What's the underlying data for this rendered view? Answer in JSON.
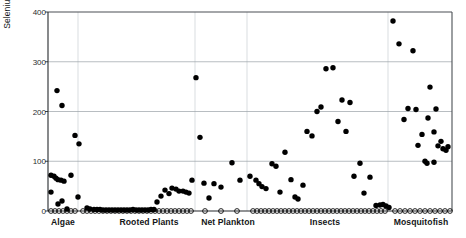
{
  "chart_data": {
    "type": "scatter",
    "title": "",
    "xlabel": "",
    "ylabel": "Selenium (µg/g, dw)",
    "ylim": [
      0,
      400
    ],
    "yticks": [
      0,
      100,
      200,
      300,
      400
    ],
    "ytick_labels": [
      "0",
      "100",
      "200",
      "300",
      "400"
    ],
    "grid": "horizontal-and-vertical-faint",
    "legend": "none",
    "categories": [
      "Algae",
      "Rooted Plants",
      "Net Plankton",
      "Insects",
      "Mosquitofish"
    ],
    "category_label_x": [
      63,
      149,
      228,
      325,
      421
    ],
    "group_dividers_x": [
      78,
      195,
      247,
      388
    ],
    "marker_detected": "filled-circle",
    "marker_nondetect": "open-circle",
    "series": [
      {
        "name": "Detected samples",
        "marker": "filled-circle",
        "color": "#000000",
        "points": [
          [
            51,
            72
          ],
          [
            54,
            70
          ],
          [
            56,
            66
          ],
          [
            58,
            63
          ],
          [
            61,
            62
          ],
          [
            64,
            60
          ],
          [
            51,
            38
          ],
          [
            58,
            14
          ],
          [
            62,
            20
          ],
          [
            67,
            4
          ],
          [
            57,
            242
          ],
          [
            62,
            212
          ],
          [
            75,
            152
          ],
          [
            79,
            135
          ],
          [
            71,
            72
          ],
          [
            78,
            28
          ],
          [
            87,
            6
          ],
          [
            90,
            4
          ],
          [
            94,
            3
          ],
          [
            97,
            3
          ],
          [
            100,
            3
          ],
          [
            103,
            2
          ],
          [
            106,
            2
          ],
          [
            109,
            2
          ],
          [
            112,
            2
          ],
          [
            115,
            2
          ],
          [
            118,
            2
          ],
          [
            121,
            2
          ],
          [
            124,
            2
          ],
          [
            127,
            2
          ],
          [
            130,
            2
          ],
          [
            133,
            3
          ],
          [
            136,
            2
          ],
          [
            139,
            2
          ],
          [
            142,
            2
          ],
          [
            145,
            2
          ],
          [
            148,
            2
          ],
          [
            151,
            3
          ],
          [
            154,
            3
          ],
          [
            157,
            18
          ],
          [
            161,
            30
          ],
          [
            165,
            42
          ],
          [
            169,
            35
          ],
          [
            172,
            46
          ],
          [
            176,
            44
          ],
          [
            179,
            40
          ],
          [
            183,
            40
          ],
          [
            186,
            38
          ],
          [
            189,
            36
          ],
          [
            192,
            62
          ],
          [
            196,
            268
          ],
          [
            200,
            148
          ],
          [
            204,
            56
          ],
          [
            209,
            26
          ],
          [
            214,
            55
          ],
          [
            221,
            48
          ],
          [
            232,
            97
          ],
          [
            240,
            62
          ],
          [
            250,
            70
          ],
          [
            256,
            62
          ],
          [
            259,
            55
          ],
          [
            262,
            49
          ],
          [
            266,
            45
          ],
          [
            272,
            95
          ],
          [
            276,
            90
          ],
          [
            280,
            38
          ],
          [
            285,
            118
          ],
          [
            291,
            63
          ],
          [
            295,
            28
          ],
          [
            298,
            24
          ],
          [
            303,
            52
          ],
          [
            307,
            160
          ],
          [
            312,
            151
          ],
          [
            317,
            200
          ],
          [
            321,
            209
          ],
          [
            326,
            286
          ],
          [
            333,
            288
          ],
          [
            338,
            180
          ],
          [
            342,
            223
          ],
          [
            346,
            160
          ],
          [
            350,
            218
          ],
          [
            354,
            70
          ],
          [
            360,
            96
          ],
          [
            364,
            36
          ],
          [
            370,
            68
          ],
          [
            376,
            11
          ],
          [
            380,
            12
          ],
          [
            383,
            13
          ],
          [
            386,
            10
          ],
          [
            389,
            7
          ],
          [
            393,
            382
          ],
          [
            399,
            336
          ],
          [
            404,
            184
          ],
          [
            408,
            206
          ],
          [
            413,
            322
          ],
          [
            416,
            204
          ],
          [
            418,
            132
          ],
          [
            422,
            154
          ],
          [
            425,
            100
          ],
          [
            428,
            187
          ],
          [
            430,
            249
          ],
          [
            434,
            159
          ],
          [
            436,
            205
          ],
          [
            438,
            131
          ],
          [
            441,
            140
          ],
          [
            443,
            125
          ],
          [
            446,
            122
          ],
          [
            448,
            129
          ],
          [
            434,
            98
          ],
          [
            427,
            96
          ]
        ]
      },
      {
        "name": "Non-detect samples (plotted at zero)",
        "marker": "open-circle",
        "color": "#000000",
        "y_value": 0,
        "x_positions": [
          51,
          55,
          59,
          63,
          67,
          71,
          75,
          83,
          87,
          91,
          95,
          99,
          103,
          107,
          111,
          115,
          119,
          123,
          127,
          131,
          135,
          139,
          143,
          147,
          151,
          155,
          159,
          163,
          167,
          171,
          175,
          179,
          183,
          187,
          191,
          205,
          221,
          237,
          253,
          257,
          261,
          265,
          269,
          273,
          277,
          281,
          285,
          289,
          293,
          297,
          301,
          305,
          309,
          313,
          317,
          321,
          325,
          329,
          333,
          337,
          341,
          345,
          349,
          353,
          357,
          361,
          365,
          369,
          373,
          377,
          381,
          385,
          395,
          400,
          405,
          410,
          415,
          420,
          425,
          430,
          435,
          440,
          445,
          450
        ]
      }
    ]
  },
  "axes": {
    "plot_left": 48,
    "plot_right": 452,
    "plot_top": 12,
    "plot_bottom": 211
  }
}
